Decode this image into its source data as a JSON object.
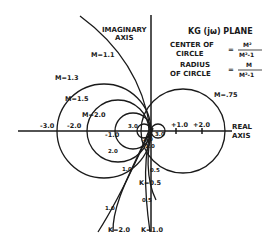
{
  "title": "KG (jω) PLANE",
  "formulas": {
    "center": {
      "label_line1": "CENTER OF",
      "label_line2": "CIRCLE",
      "eq": "=",
      "numerator": "M²",
      "denominator": "M²-1"
    },
    "radius": {
      "label_line1": "RADIUS",
      "label_line2": "OF CIRCLE",
      "eq": "=",
      "numerator": "M",
      "denominator": "M²-1"
    }
  },
  "axes": {
    "imaginary_label_line1": "IMAGINARY",
    "imaginary_label_line2": "AXIS",
    "real_label_line1": "REAL",
    "real_label_line2": "AXIS",
    "real_ticks": [
      "-3.0",
      "-2.0",
      "-1.0",
      "+1.0",
      "+2.0"
    ]
  },
  "m_circles": [
    {
      "label": "M=1.1",
      "M": 1.1
    },
    {
      "label": "M=1.3",
      "M": 1.3
    },
    {
      "label": "M=1.5",
      "M": 1.5
    },
    {
      "label": "M=2.0",
      "M": 2.0
    },
    {
      "label": "M=.75",
      "M": 0.75
    }
  ],
  "k_loci": [
    {
      "label": "K=2.0",
      "points": [
        "3.0",
        "2.0",
        "1.0",
        "1.0"
      ]
    },
    {
      "label": "K=1.0",
      "points": [
        "3.0",
        "2.0",
        "1.0",
        "0.5"
      ]
    },
    {
      "label": "K=0.5",
      "points": [
        "0.5"
      ]
    }
  ],
  "frequency_labels": [
    "3.0",
    "2.0",
    "1.0",
    "1.0",
    "0.5",
    "0.5",
    "3.0",
    "2.0",
    "1.0"
  ]
}
